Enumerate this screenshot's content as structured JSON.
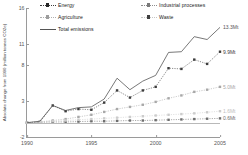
{
  "chart_data": {
    "type": "line",
    "title": "",
    "xlabel": "",
    "ylabel": "Absolute change from 1990 (million tonnes CO2e)",
    "x": [
      1990,
      1991,
      1992,
      1993,
      1994,
      1995,
      1996,
      1997,
      1998,
      1999,
      2000,
      2001,
      2002,
      2003,
      2004,
      2005
    ],
    "xlim": [
      1990,
      2005
    ],
    "ylim": [
      -2,
      16
    ],
    "yticks": [
      "16",
      "11",
      "8",
      "3",
      "-2"
    ],
    "ytick_values": [
      16,
      11,
      8,
      3,
      -2
    ],
    "xticks": [
      "1990",
      "1995",
      "2000",
      "2005"
    ],
    "xtick_values": [
      1990,
      1995,
      2000,
      2005
    ],
    "grid": false,
    "legend_position": "top",
    "series": [
      {
        "name": "Energy",
        "marker": "square",
        "color": "#3c3c3c",
        "end_label": "9.9Mt",
        "end_value": 9.9,
        "values": [
          0,
          0.1,
          2.4,
          1.6,
          1.9,
          1.8,
          2.8,
          4.5,
          3.5,
          4.5,
          5.0,
          7.6,
          7.5,
          8.8,
          8.2,
          9.9
        ]
      },
      {
        "name": "Industrial processes",
        "marker": "square",
        "color": "#6e6e6e",
        "end_label": "0.6Mt",
        "end_value": 0.6,
        "values": [
          0,
          0.05,
          0.1,
          0.1,
          0.15,
          0.2,
          0.2,
          0.25,
          0.3,
          0.3,
          0.35,
          0.4,
          0.45,
          0.5,
          0.55,
          0.6
        ]
      },
      {
        "name": "Agriculture",
        "marker": "square",
        "color": "#a8a8a8",
        "end_label": "5.0Mt",
        "end_value": 5.0,
        "values": [
          0,
          0.1,
          0.3,
          0.5,
          0.8,
          1.1,
          1.5,
          1.9,
          2.2,
          2.5,
          2.9,
          3.4,
          3.8,
          4.3,
          4.6,
          5.0
        ]
      },
      {
        "name": "Waste",
        "marker": "square",
        "color": "#cccccc",
        "end_label": "1.6Mt",
        "end_value": 1.6,
        "values": [
          0,
          0.1,
          0.2,
          0.3,
          0.4,
          0.5,
          0.6,
          0.7,
          0.8,
          0.9,
          1.0,
          1.1,
          1.2,
          1.3,
          1.45,
          1.6
        ]
      },
      {
        "name": "Total emissions",
        "marker": "none",
        "color": "#555555",
        "end_label": "13.3Mt",
        "end_value": 13.3,
        "values": [
          0,
          0.2,
          2.4,
          1.7,
          2.1,
          2.2,
          3.3,
          6.2,
          4.6,
          5.8,
          6.6,
          9.8,
          9.9,
          12.0,
          11.6,
          13.3
        ]
      }
    ]
  },
  "legend": {
    "items": [
      {
        "label": "Energy"
      },
      {
        "label": "Industrial processes"
      },
      {
        "label": "Agriculture"
      },
      {
        "label": "Waste"
      },
      {
        "label": "Total emissions"
      }
    ]
  }
}
